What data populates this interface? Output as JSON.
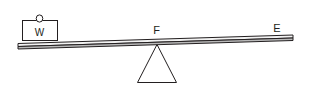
{
  "figure": {
    "background_color": "#ffffff",
    "stroke_color": "#231f20",
    "beam_face_color": "#f2f2f2",
    "beam_edge_color": "#b9b9b9"
  },
  "labels": {
    "fulcrum": "F",
    "effort_end": "E",
    "weight": "W"
  },
  "parts": {
    "beam_name": "lever beam",
    "block_name": "weight block",
    "fulcrum_name": "triangular fulcrum",
    "ring_name": "hook ring"
  }
}
